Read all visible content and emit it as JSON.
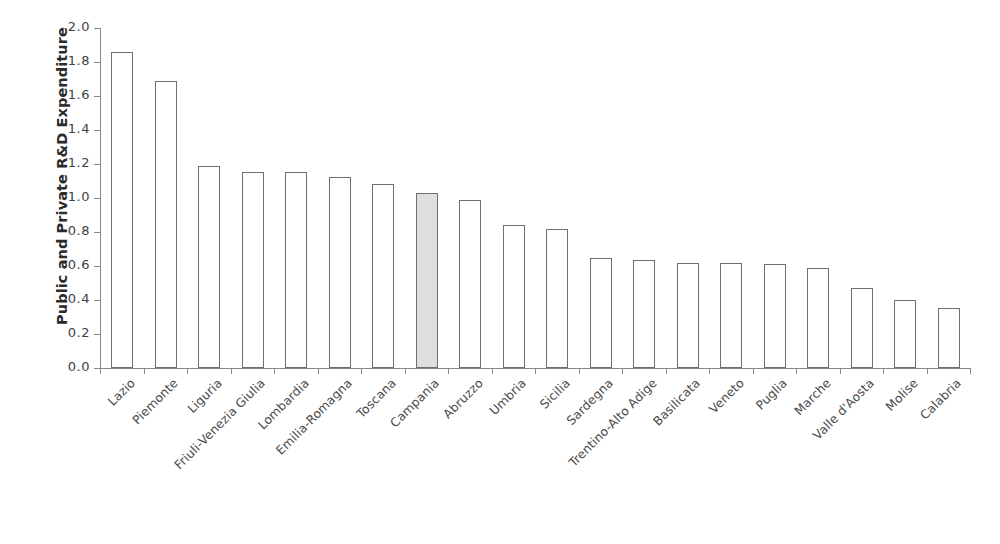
{
  "chart_data": {
    "type": "bar",
    "title": "",
    "xlabel": "",
    "ylabel": "Public and Private R&D Expenditure",
    "ylim": [
      0.0,
      2.0
    ],
    "ytick_labels": [
      "0.0",
      "0.2",
      "0.4",
      "0.6",
      "0.8",
      "1.0",
      "1.2",
      "1.4",
      "1.6",
      "1.8",
      "2.0"
    ],
    "ytick_values": [
      0.0,
      0.2,
      0.4,
      0.6,
      0.8,
      1.0,
      1.2,
      1.4,
      1.6,
      1.8,
      2.0
    ],
    "grid": false,
    "legend": "none",
    "categories": [
      "Lazio",
      "Piemonte",
      "Liguria",
      "Friuli-Venezia Giulia",
      "Lombardia",
      "Emilia-Romagna",
      "Toscana",
      "Campania",
      "Abruzzo",
      "Umbria",
      "Sicilia",
      "Sardegna",
      "Trentino-Alto Adige",
      "Basilicata",
      "Veneto",
      "Puglia",
      "Marche",
      "Valle d'Aosta",
      "Molise",
      "Calabria"
    ],
    "values": [
      1.86,
      1.69,
      1.19,
      1.155,
      1.155,
      1.125,
      1.08,
      1.03,
      0.99,
      0.84,
      0.82,
      0.65,
      0.635,
      0.62,
      0.62,
      0.61,
      0.59,
      0.47,
      0.4,
      0.355
    ],
    "highlight_category": "Campania",
    "highlight_index": 7,
    "colors": {
      "bar_fill": "#ffffff",
      "bar_border": "#6f6f6f",
      "highlight_fill": "#dedede",
      "axis": "#8a8a8a",
      "text": "#3f3f3f",
      "background": "#ffffff"
    }
  }
}
